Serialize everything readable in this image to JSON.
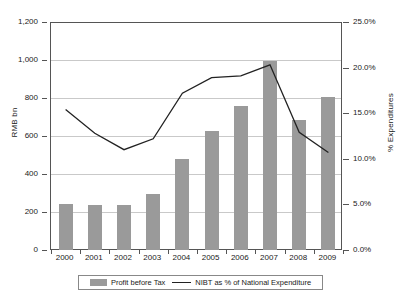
{
  "chart_data": {
    "type": "bar",
    "title": "",
    "categories": [
      "2000",
      "2001",
      "2002",
      "2003",
      "2004",
      "2005",
      "2006",
      "2007",
      "2008",
      "2009"
    ],
    "series": [
      {
        "name": "Profit before Tax",
        "type": "bar",
        "axis": "left",
        "color": "#9a9a9a",
        "values": [
          240,
          235,
          237,
          295,
          478,
          628,
          758,
          997,
          682,
          803
        ]
      },
      {
        "name": "NIBT as % of National Expenditure",
        "type": "line",
        "axis": "right",
        "color": "#222222",
        "values": [
          15.4,
          12.8,
          11.0,
          12.2,
          17.2,
          18.9,
          19.1,
          20.3,
          12.9,
          10.7
        ]
      }
    ],
    "xlabel": "",
    "ylabel": "RMB bn",
    "y2label": "% Expenditures",
    "ylim": [
      0,
      1200
    ],
    "y2lim": [
      0,
      25
    ],
    "yticks": [
      "0",
      "200",
      "400",
      "600",
      "800",
      "1,000",
      "1,200"
    ],
    "y2ticks": [
      "0.0%",
      "5.0%",
      "10.0%",
      "15.0%",
      "20.0%",
      "25.0%"
    ],
    "grid": true,
    "legend_position": "bottom"
  },
  "axes": {
    "left_title": "RMB bn",
    "right_title": "% Expenditures"
  },
  "legend": {
    "items": [
      {
        "label": "Profit before Tax",
        "marker": "bar-swatch"
      },
      {
        "label": "NIBT as % of National Expenditure",
        "marker": "line-swatch"
      }
    ]
  }
}
